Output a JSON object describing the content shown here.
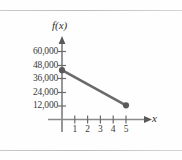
{
  "figure": {
    "background_color": "#fefefe",
    "rule_color": "#c9c9cc",
    "has_top_rule": true,
    "has_bottom_rule": true
  },
  "axes": {
    "x_axis_label": "x",
    "y_axis_label": "f(x)",
    "axis_color": "#6b6b6b",
    "x_tick_labels": [
      "1",
      "2",
      "3",
      "4",
      "5"
    ],
    "y_tick_labels": [
      "12,000",
      "24,000",
      "36,000",
      "48,000",
      "60,000"
    ]
  },
  "plot": {
    "line_color": "#6a6a6a",
    "marker_color": "#5a5a5a"
  },
  "chart_data": {
    "type": "line",
    "title": "",
    "xlabel": "x",
    "ylabel": "f(x)",
    "xlim": [
      0,
      5.8
    ],
    "ylim": [
      0,
      66000
    ],
    "xticks": [
      1,
      2,
      3,
      4,
      5
    ],
    "yticks": [
      12000,
      24000,
      36000,
      48000,
      60000
    ],
    "ytick_labels": [
      "12,000",
      "24,000",
      "36,000",
      "48,000",
      "60,000"
    ],
    "grid": false,
    "legend": false,
    "series": [
      {
        "name": "f(x)",
        "x": [
          0,
          5
        ],
        "y": [
          43500,
          12500
        ],
        "markers": [
          {
            "x": 0,
            "y": 43500
          },
          {
            "x": 5,
            "y": 12500
          }
        ]
      }
    ]
  }
}
